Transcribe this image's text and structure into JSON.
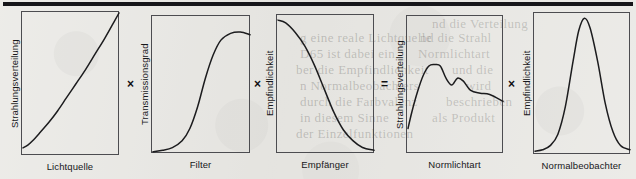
{
  "figure": {
    "width": 636,
    "height": 179,
    "background_color": "#e9e8e4",
    "ink_color": "#1c1c1e",
    "rule_color": "#16161a",
    "top_rule": "horizontal-black-rule"
  },
  "equation": {
    "description": "Strahlungsverteilung der Lichtquelle x Transmissionsgrad des Filters x Empfindlichkeit des Empfaengers = Strahlungsverteilung der Normlichtart x Empfindlichkeit des Normalbeobachters",
    "operators": [
      {
        "symbol": "×",
        "name": "multiply-1",
        "x": 127,
        "y": 78
      },
      {
        "symbol": "×",
        "name": "multiply-2",
        "x": 254,
        "y": 78
      },
      {
        "symbol": "=",
        "name": "equals",
        "x": 381,
        "y": 78
      },
      {
        "symbol": "×",
        "name": "multiply-3",
        "x": 508,
        "y": 78
      }
    ]
  },
  "panels": [
    {
      "id": "lichtquelle",
      "ylabel": "Strahlungsverteilung",
      "xlabel": "Lichtquelle",
      "box": {
        "x": 21,
        "y": 11,
        "w": 98,
        "h": 144
      },
      "curve_name": "rising-radiation-distribution-curve"
    },
    {
      "id": "filter",
      "ylabel": "Transmissionsgrad",
      "xlabel": "Filter",
      "box": {
        "x": 151,
        "y": 15,
        "w": 99,
        "h": 138
      },
      "curve_name": "sigmoid-transmittance-curve"
    },
    {
      "id": "empfaenger",
      "ylabel": "Empfindlichkeit",
      "xlabel": "Empfänger",
      "box": {
        "x": 276,
        "y": 14,
        "w": 98,
        "h": 139
      },
      "curve_name": "falling-sensitivity-curve"
    },
    {
      "id": "normlichtart",
      "ylabel": "Strahlungsverteilung",
      "xlabel": "Normlichtart",
      "box": {
        "x": 406,
        "y": 15,
        "w": 97,
        "h": 138
      },
      "curve_name": "standard-illuminant-spectrum-curve"
    },
    {
      "id": "normalbeobachter",
      "ylabel": "Empfindlichkeit",
      "xlabel": "Normalbeobachter",
      "box": {
        "x": 533,
        "y": 12,
        "w": 97,
        "h": 142
      },
      "curve_name": "observer-bell-sensitivity-curve"
    }
  ],
  "chart_data": [
    {
      "type": "line",
      "title": "Lichtquelle",
      "xlabel": "Lichtquelle",
      "ylabel": "Strahlungsverteilung",
      "grid": false,
      "legend": "none",
      "xlim": [
        0,
        1
      ],
      "ylim": [
        0,
        1
      ],
      "x": [
        0.0,
        0.05,
        0.1,
        0.18,
        0.27,
        0.36,
        0.45,
        0.55,
        0.65,
        0.75,
        0.85,
        0.95,
        1.0
      ],
      "values": [
        0.05,
        0.07,
        0.1,
        0.16,
        0.23,
        0.31,
        0.4,
        0.5,
        0.6,
        0.71,
        0.82,
        0.94,
        1.0
      ]
    },
    {
      "type": "line",
      "title": "Filter",
      "xlabel": "Filter",
      "ylabel": "Transmissionsgrad",
      "grid": false,
      "legend": "none",
      "xlim": [
        0,
        1
      ],
      "ylim": [
        0,
        1
      ],
      "x": [
        0.0,
        0.1,
        0.2,
        0.3,
        0.38,
        0.46,
        0.54,
        0.62,
        0.7,
        0.8,
        0.9,
        1.0
      ],
      "values": [
        0.01,
        0.02,
        0.04,
        0.09,
        0.18,
        0.34,
        0.55,
        0.72,
        0.83,
        0.88,
        0.89,
        0.87
      ]
    },
    {
      "type": "line",
      "title": "Empfänger",
      "xlabel": "Empfänger",
      "ylabel": "Empfindlichkeit",
      "grid": false,
      "legend": "none",
      "xlim": [
        0,
        1
      ],
      "ylim": [
        0,
        1
      ],
      "x": [
        0.0,
        0.08,
        0.18,
        0.28,
        0.38,
        0.48,
        0.58,
        0.68,
        0.78,
        0.88,
        1.0
      ],
      "values": [
        0.97,
        0.95,
        0.88,
        0.78,
        0.64,
        0.47,
        0.3,
        0.17,
        0.09,
        0.04,
        0.02
      ]
    },
    {
      "type": "line",
      "title": "Normlichtart",
      "xlabel": "Normlichtart",
      "ylabel": "Strahlungsverteilung",
      "grid": false,
      "legend": "none",
      "xlim": [
        0,
        1
      ],
      "ylim": [
        0,
        1
      ],
      "x": [
        0.0,
        0.04,
        0.1,
        0.16,
        0.22,
        0.28,
        0.34,
        0.4,
        0.46,
        0.52,
        0.58,
        0.66,
        0.76,
        0.86,
        1.0
      ],
      "values": [
        0.18,
        0.3,
        0.45,
        0.57,
        0.64,
        0.65,
        0.64,
        0.55,
        0.5,
        0.55,
        0.53,
        0.46,
        0.44,
        0.43,
        0.38
      ]
    },
    {
      "type": "line",
      "title": "Normalbeobachter",
      "xlabel": "Normalbeobachter",
      "ylabel": "Empfindlichkeit",
      "grid": false,
      "legend": "none",
      "xlim": [
        0,
        1
      ],
      "ylim": [
        0,
        1
      ],
      "x": [
        0.0,
        0.08,
        0.16,
        0.24,
        0.32,
        0.4,
        0.46,
        0.52,
        0.58,
        0.66,
        0.74,
        0.82,
        0.9,
        1.0
      ],
      "values": [
        0.02,
        0.03,
        0.06,
        0.14,
        0.34,
        0.66,
        0.88,
        0.97,
        0.9,
        0.66,
        0.36,
        0.16,
        0.06,
        0.03
      ]
    }
  ],
  "background_bleed": [
    {
      "text": "nd die Verteilung",
      "x": 432,
      "y": 16
    },
    {
      "text": "g eine reale Lichtquelle",
      "x": 300,
      "y": 30
    },
    {
      "text": "nd die Strahl",
      "x": 420,
      "y": 30
    },
    {
      "text": "D65 ist dabei ein",
      "x": 300,
      "y": 46
    },
    {
      "text": "Normlichtart",
      "x": 418,
      "y": 46
    },
    {
      "text": "ber die Empfindlichkeit",
      "x": 296,
      "y": 62
    },
    {
      "text": "und die",
      "x": 452,
      "y": 62
    },
    {
      "text": "n Normalbeobachters",
      "x": 300,
      "y": 78
    },
    {
      "text": "wird",
      "x": 466,
      "y": 78
    },
    {
      "text": "durch die Farbvalenz",
      "x": 300,
      "y": 94
    },
    {
      "text": "beschrieben",
      "x": 446,
      "y": 94
    },
    {
      "text": "in diesem Sinne",
      "x": 300,
      "y": 110
    },
    {
      "text": "als Produkt",
      "x": 432,
      "y": 110
    },
    {
      "text": "der Einzelfunktionen",
      "x": 296,
      "y": 126
    }
  ]
}
